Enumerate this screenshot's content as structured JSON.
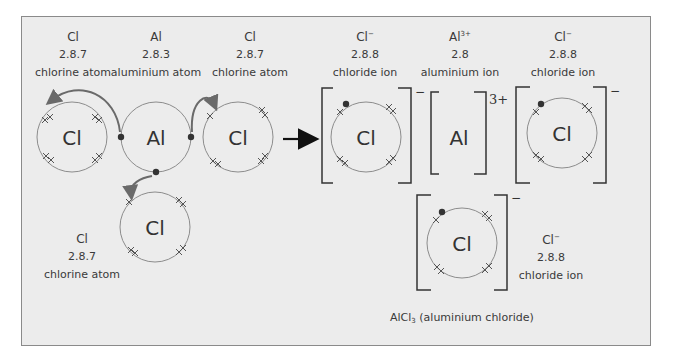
{
  "diagram": {
    "colors": {
      "background": "#ececec",
      "frame_border": "#8a8a8a",
      "shell": "#8c8c8c",
      "electron_dot": "#333333",
      "electron_cross": "#555555",
      "transfer_arrow": "#6a6a6a",
      "reaction_arrow": "#111111",
      "bracket": "#333333"
    },
    "reactants": [
      {
        "symbol": "Cl",
        "config": "2.8.7",
        "name": "chlorine atom",
        "position": "left"
      },
      {
        "symbol": "Al",
        "config": "2.8.3",
        "name": "aluminium atom",
        "position": "center"
      },
      {
        "symbol": "Cl",
        "config": "2.8.7",
        "name": "chlorine atom",
        "position": "right"
      },
      {
        "symbol": "Cl",
        "config": "2.8.7",
        "name": "chlorine atom",
        "position": "bottom"
      }
    ],
    "products": [
      {
        "symbol": "Cl",
        "charge": "−",
        "config": "2.8.8",
        "name": "chloride ion",
        "position": "left"
      },
      {
        "symbol": "Al",
        "charge": "3+",
        "config": "2.8",
        "name": "aluminium ion",
        "position": "center"
      },
      {
        "symbol": "Cl",
        "charge": "−",
        "config": "2.8.8",
        "name": "chloride ion",
        "position": "right"
      },
      {
        "symbol": "Cl",
        "charge": "−",
        "config": "2.8.8",
        "name": "chloride ion",
        "position": "bottom"
      }
    ],
    "reaction_arrow": "→",
    "formula": {
      "main": "AlCl",
      "subscript": "3",
      "description": " (aluminium chloride)"
    }
  }
}
